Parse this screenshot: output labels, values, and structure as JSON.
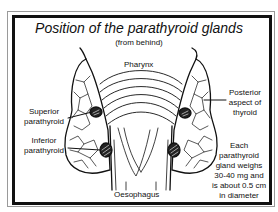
{
  "title": "Position of the parathyroid glands",
  "subtitle": "(from behind)",
  "labels": {
    "pharynx": "Pharynx",
    "superior_l1": "Superior",
    "superior_l2": "parathyroid",
    "inferior_l1": "Inferior",
    "inferior_l2": "parathyroid",
    "posterior_l1": "Posterior",
    "posterior_l2": "aspect of",
    "posterior_l3": "thyroid",
    "oesophagus": "Oesophagus",
    "note_l1": "Each",
    "note_l2": "parathyroid",
    "note_l3": "gland weighs",
    "note_l4": "30-40 mg and",
    "note_l5": "is about 0.5 cm",
    "note_l6": "in diameter"
  },
  "colors": {
    "ink": "#111111",
    "frame_outer": "#9a9a9a",
    "background": "#ffffff"
  }
}
